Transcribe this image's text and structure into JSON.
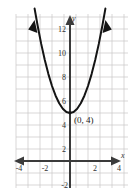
{
  "choice": {
    "label": "(4)"
  },
  "chart_data": {
    "type": "line",
    "title": "",
    "subtitle": "",
    "xlabel": "x",
    "ylabel": "y",
    "xlim": [
      -4.6,
      4.6
    ],
    "ylim": [
      -2.6,
      12.8
    ],
    "grid": true,
    "grid_step": 1,
    "legend": "none",
    "x_ticks": [
      -4,
      -2,
      2,
      4
    ],
    "x_tick_labels": [
      "-4",
      "-2",
      "2",
      "4"
    ],
    "y_ticks": [
      -2,
      2,
      4,
      6,
      8,
      10,
      12
    ],
    "y_tick_labels": [
      "-2",
      "2",
      "4",
      "6",
      "8",
      "10",
      "12"
    ],
    "curve": {
      "name": "parabola",
      "equation": "y = x^2 + 4",
      "vertex": [
        0,
        4
      ],
      "opens": "up",
      "arrowheads": [
        "left-end",
        "right-end"
      ],
      "x": [
        -2.95,
        -2.7,
        -2.4,
        -2.1,
        -1.8,
        -1.5,
        -1.2,
        -0.9,
        -0.6,
        -0.3,
        0,
        0.3,
        0.6,
        0.9,
        1.2,
        1.5,
        1.8,
        2.1,
        2.4,
        2.7,
        2.95
      ],
      "y": [
        12.7,
        11.29,
        9.76,
        8.41,
        7.24,
        6.25,
        5.44,
        4.81,
        4.36,
        4.09,
        4,
        4.09,
        4.36,
        4.81,
        5.44,
        6.25,
        7.24,
        8.41,
        9.76,
        11.29,
        12.7
      ]
    },
    "annotations": [
      {
        "name": "vertex-label",
        "text": "(0, 4)",
        "at": [
          0.35,
          3.35
        ]
      }
    ],
    "colors": {
      "grid": "#c9c6c6",
      "axis": "#3b3b3b",
      "curve": "#141414",
      "background": "#ffffff",
      "text": "#333333"
    }
  }
}
